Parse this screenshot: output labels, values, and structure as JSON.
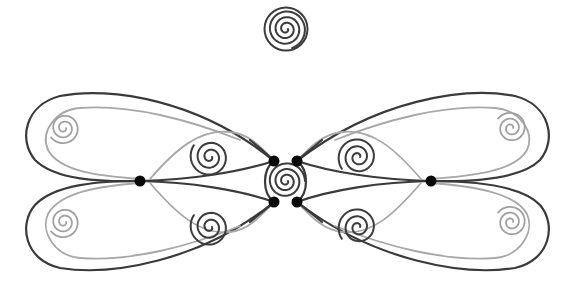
{
  "diagram": {
    "title": "",
    "colors": {
      "background": "#ffffff",
      "dark_stroke": "#3a3a3a",
      "light_stroke": "#a8a8a8",
      "node_fill": "#0a0a0a"
    },
    "top_spiral": {
      "cx": 286,
      "cy": 29,
      "r": 20,
      "turns": 3.2,
      "double_outer": true
    },
    "center_spiral": {
      "cx": 286,
      "cy": 181,
      "r": 19,
      "turns": 3.0
    },
    "outer_spirals": [
      {
        "name": "upper-left",
        "cx": 64,
        "cy": 128,
        "r": 16,
        "turns": 2.4,
        "dir": 1
      },
      {
        "name": "lower-left",
        "cx": 64,
        "cy": 222,
        "r": 16,
        "turns": 2.4,
        "dir": 1
      },
      {
        "name": "upper-right",
        "cx": 511,
        "cy": 128,
        "r": 16,
        "turns": 2.4,
        "dir": -1
      },
      {
        "name": "lower-right",
        "cx": 511,
        "cy": 222,
        "r": 16,
        "turns": 2.4,
        "dir": -1
      }
    ],
    "inner_spirals": [
      {
        "name": "upper-left-inner",
        "cx": 210,
        "cy": 157,
        "r": 20,
        "turns": 2.6,
        "dir": 1
      },
      {
        "name": "lower-left-inner",
        "cx": 210,
        "cy": 227,
        "r": 20,
        "turns": 2.6,
        "dir": 1
      },
      {
        "name": "upper-right-inner",
        "cx": 358,
        "cy": 157,
        "r": 20,
        "turns": 2.6,
        "dir": -1
      },
      {
        "name": "lower-right-inner",
        "cx": 358,
        "cy": 227,
        "r": 20,
        "turns": 2.6,
        "dir": -1
      }
    ],
    "nodes": [
      {
        "name": "left-junction",
        "x": 140,
        "y": 181
      },
      {
        "name": "right-junction",
        "x": 431,
        "y": 181
      },
      {
        "name": "center-top-left",
        "x": 274,
        "y": 161
      },
      {
        "name": "center-top-right",
        "x": 297,
        "y": 161
      },
      {
        "name": "center-bottom-left",
        "x": 274,
        "y": 202
      },
      {
        "name": "center-bottom-right",
        "x": 297,
        "y": 202
      }
    ],
    "node_radius": 5.5
  }
}
